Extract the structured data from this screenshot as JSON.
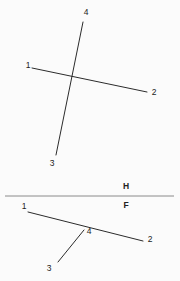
{
  "figure": {
    "background_color": "#fbfbfb",
    "line_color": "#2b2b2b",
    "fold_line_color": "#8a8a8a",
    "label_color": "#222222",
    "width": 180,
    "height": 281
  },
  "top_view": {
    "name": "top-view",
    "lines": [
      {
        "id": "line-1-2-top",
        "from_label": "1",
        "to_label": "2",
        "x1": 32,
        "y1": 68,
        "x2": 147,
        "y2": 92
      },
      {
        "id": "line-4-3-top",
        "from_label": "4",
        "to_label": "3",
        "x1": 83,
        "y1": 22,
        "x2": 56,
        "y2": 155
      }
    ],
    "labels": [
      {
        "id": "label-1-top",
        "text": "1",
        "x": 28,
        "y": 66
      },
      {
        "id": "label-2-top",
        "text": "2",
        "x": 154,
        "y": 93
      },
      {
        "id": "label-3-top",
        "text": "3",
        "x": 52,
        "y": 164
      },
      {
        "id": "label-4-top",
        "text": "4",
        "x": 86,
        "y": 13
      }
    ]
  },
  "fold_line": {
    "name": "h-f-fold-line",
    "x1": 5,
    "y1": 196,
    "x2": 174,
    "y2": 196,
    "upper_label": {
      "id": "label-h",
      "text": "H",
      "x": 126,
      "y": 187
    },
    "lower_label": {
      "id": "label-f",
      "text": "F",
      "x": 126,
      "y": 206
    }
  },
  "front_view": {
    "name": "front-view",
    "lines": [
      {
        "id": "line-1-2-front",
        "from_label": "1",
        "to_label": "2",
        "x1": 28,
        "y1": 212,
        "x2": 143,
        "y2": 241
      },
      {
        "id": "line-4-3-front",
        "from_label": "4",
        "to_label": "3",
        "x1": 84,
        "y1": 230,
        "x2": 58,
        "y2": 262
      }
    ],
    "labels": [
      {
        "id": "label-1-front",
        "text": "1",
        "x": 24,
        "y": 207
      },
      {
        "id": "label-2-front",
        "text": "2",
        "x": 150,
        "y": 240
      },
      {
        "id": "label-3-front",
        "text": "3",
        "x": 49,
        "y": 269
      },
      {
        "id": "label-4-front",
        "text": "4",
        "x": 89,
        "y": 232
      }
    ]
  }
}
